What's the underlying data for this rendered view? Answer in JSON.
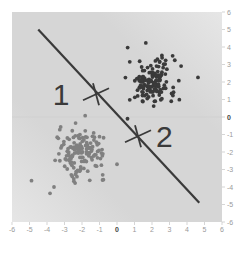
{
  "chart_data": {
    "type": "scatter",
    "title": "",
    "xlabel": "",
    "ylabel": "",
    "xlim": [
      -6,
      6
    ],
    "ylim": [
      -6,
      6
    ],
    "grid": false,
    "x_ticks": [
      -6,
      -5,
      -4,
      -3,
      -2,
      -1,
      0,
      1,
      2,
      3,
      4,
      5,
      6
    ],
    "y_ticks": [
      6,
      5,
      4,
      3,
      2,
      1,
      0,
      -1,
      -2,
      -3,
      -4,
      -5,
      -6
    ],
    "series": [
      {
        "name": "cluster-upper-right",
        "color": "#3a3a3a",
        "center": [
          2,
          2
        ],
        "spread": 0.9,
        "count": 150
      },
      {
        "name": "cluster-lower-left",
        "color": "#808080",
        "center": [
          -2,
          -2
        ],
        "spread": 0.9,
        "count": 150
      }
    ],
    "outliers": [
      {
        "series": "cluster-upper-right",
        "x": 0.6,
        "y": -0.1
      },
      {
        "series": "cluster-upper-right",
        "x": 3.1,
        "y": 0.9
      },
      {
        "series": "cluster-lower-left",
        "x": -3.6,
        "y": -4.0
      },
      {
        "series": "cluster-lower-left",
        "x": 0.0,
        "y": -2.7
      }
    ],
    "decision_line": {
      "x1": -4.5,
      "y1": 5.0,
      "x2": 4.7,
      "y2": -4.9,
      "color": "#3a3a3a"
    },
    "annotations": [
      {
        "label": "1",
        "marker_x": -1.2,
        "marker_y": 1.3,
        "text_x": -3.2,
        "text_y": 1.3
      },
      {
        "label": "2",
        "marker_x": 1.2,
        "marker_y": -1.1,
        "text_x": 2.7,
        "text_y": -1.1
      }
    ],
    "background": {
      "base": "#d6d6d6",
      "light": "#e6e6e6"
    }
  }
}
